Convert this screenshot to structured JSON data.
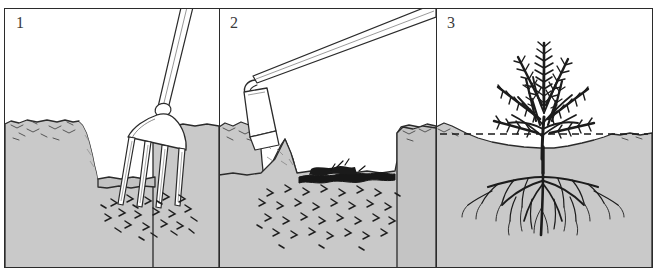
{
  "figure": {
    "width": 657,
    "height": 277,
    "style": "black-and-white line illustration, cross-section view",
    "background_color": "#ffffff",
    "frame_color": "#2b2b2b"
  },
  "colors": {
    "ink": "#2b2b2b",
    "soil_fill": "#c9c9c9",
    "soil_fill_dark": "#bdbdbd",
    "subsoil_fill": "#c4c4c4",
    "organic_matter": "#1a1a1a",
    "tool_fill": "#ffffff",
    "plant_ink": "#1c1c1c",
    "dashed_line": "#1a1a1a",
    "sky_fill": "#ffffff"
  },
  "panels": [
    {
      "id": "panel-1",
      "number": "1",
      "caption_implied": "Loosening the base of the trench with a garden fork",
      "elements": [
        "open trench with vertical left wall",
        "garden fork with four tines driven into trench floor",
        "fork handle angled up to upper right, exiting frame",
        "broken soil clods at the fork tines",
        "undisturbed soil bank on the right"
      ],
      "tool": {
        "name": "garden-fork",
        "tine_count": 4,
        "handle_angle_degrees": 28
      }
    },
    {
      "id": "panel-2",
      "number": "2",
      "caption_implied": "Forking organic matter into the bottom of the trench with a hoe",
      "elements": [
        "long-handled hoe pushing soil from the left bank into the trench",
        "dark band of organic matter / compost spread on the trench floor",
        "loose broken soil filling the trench base",
        "soil bank standing on the right"
      ],
      "tool": {
        "name": "draw-hoe",
        "blade_shape": "rectangular",
        "handle_angle_degrees": 32
      }
    },
    {
      "id": "panel-3",
      "number": "3",
      "caption_implied": "The planted shrub after the trench is refilled; dashed line marks the original soil level",
      "elements": [
        "established shrub with feathery conifer-like foliage",
        "branching fibrous root system spreading in the refilled soil",
        "dashed horizontal line indicating the original soil surface",
        "settled soil surface dipping below the dashed line"
      ],
      "plant": {
        "name": "shrub",
        "foliage_type": "feathery needle-like sprays",
        "root_type": "branching fibrous roots"
      },
      "annotation": {
        "name": "original-soil-level-dashed-line",
        "style": "dashed"
      }
    }
  ]
}
